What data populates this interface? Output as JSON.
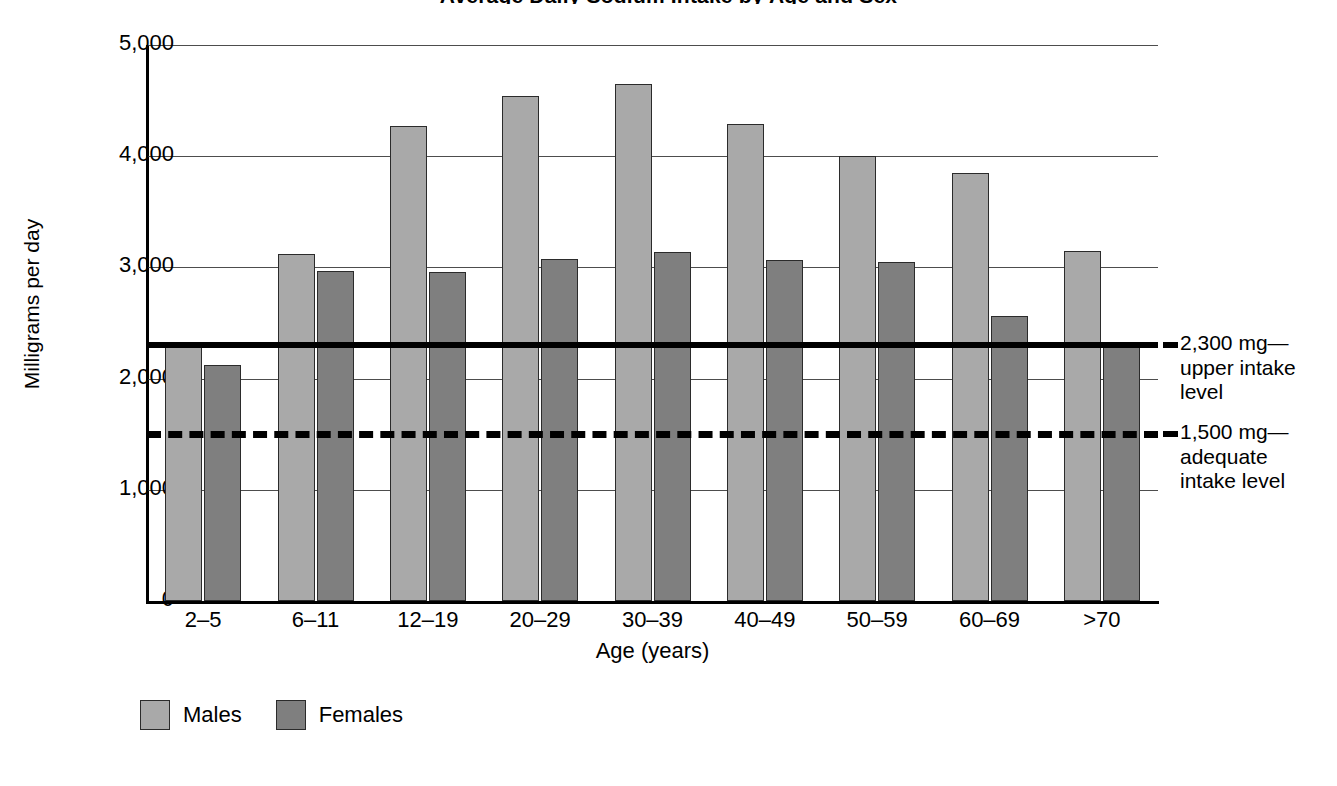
{
  "chart_data": {
    "type": "bar",
    "title": "Average Daily Sodium Intake by Age and Sex",
    "xlabel": "Age (years)",
    "ylabel": "Milligrams per day",
    "ylim": [
      0,
      5000
    ],
    "ytick_labels": [
      "5,000",
      "4,000",
      "3,000",
      "2,000",
      "1,000",
      "0"
    ],
    "ytick_values": [
      5000,
      4000,
      3000,
      2000,
      1000,
      0
    ],
    "grid": "horizontal",
    "legend_position": "bottom-left",
    "categories": [
      "2–5",
      "6–11",
      "12–19",
      "20–29",
      "30–39",
      "40–49",
      "50–59",
      "60–69",
      ">70"
    ],
    "series": [
      {
        "name": "Males",
        "color": "#a9a9a9",
        "values": [
          2330,
          3120,
          4270,
          4540,
          4650,
          4290,
          4000,
          3850,
          3150
        ]
      },
      {
        "name": "Females",
        "color": "#7f7f7f",
        "values": [
          2120,
          2970,
          2960,
          3080,
          3140,
          3070,
          3050,
          2560,
          2310
        ]
      }
    ],
    "reference_lines": [
      {
        "value": 2300,
        "style": "solid",
        "label_line1": "2,300 mg—",
        "label_line2": "upper intake",
        "label_line3": "level"
      },
      {
        "value": 1500,
        "style": "dashed",
        "label_line1": "1,500 mg—",
        "label_line2": "adequate",
        "label_line3": "intake level"
      }
    ]
  }
}
